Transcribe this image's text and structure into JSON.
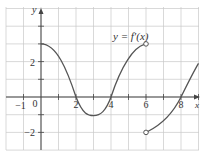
{
  "chart_data": {
    "type": "line",
    "title": "",
    "function_label": "y = f′(x)",
    "xlabel": "x",
    "ylabel": "y",
    "xlim": [
      -2,
      9
    ],
    "ylim": [
      -2.8,
      5
    ],
    "grid": true,
    "x_tick_labels": [
      {
        "value": -1,
        "label": "−1"
      },
      {
        "value": 0,
        "label": "0"
      },
      {
        "value": 2,
        "label": "2"
      },
      {
        "value": 4,
        "label": "4"
      },
      {
        "value": 6,
        "label": "6"
      },
      {
        "value": 8,
        "label": "8"
      }
    ],
    "y_tick_labels": [
      {
        "value": 2,
        "label": "2"
      },
      {
        "value": -2,
        "label": "−2"
      }
    ],
    "series": [
      {
        "name": "f'(x) piece 1",
        "x": [
          0,
          1,
          2,
          3,
          4,
          5,
          6
        ],
        "y": [
          3,
          2.4,
          0,
          -1,
          0,
          2.2,
          3
        ],
        "end_marker": {
          "x": 6,
          "y": 3,
          "type": "open"
        }
      },
      {
        "name": "f'(x) piece 2",
        "x": [
          6,
          7,
          8,
          9
        ],
        "y": [
          -2,
          -1.3,
          0,
          1.8
        ],
        "start_marker": {
          "x": 6,
          "y": -2,
          "type": "open"
        }
      }
    ],
    "colors": {
      "curve": "#555555",
      "grid": "#c8c8c8",
      "axis": "#444444"
    }
  }
}
